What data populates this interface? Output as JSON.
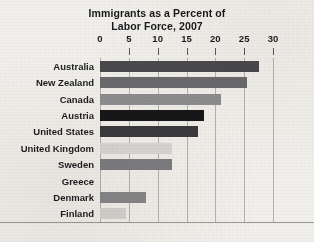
{
  "chart_data": {
    "type": "bar",
    "orientation": "horizontal",
    "title": "Immigrants as a Percent of Labor Force, 2007",
    "title_lines": [
      "Immigrants as a Percent of",
      "Labor Force, 2007"
    ],
    "xlabel": "",
    "ylabel": "",
    "xlim": [
      0,
      30
    ],
    "xticks": [
      0,
      5,
      10,
      15,
      20,
      25,
      30
    ],
    "xtick_labels": [
      "0",
      "5",
      "10",
      "15",
      "20",
      "25",
      "30"
    ],
    "grid": true,
    "grid_axis": "x",
    "legend": false,
    "categories": [
      "Australia",
      "New Zealand",
      "Canada",
      "Austria",
      "United States",
      "United Kingdom",
      "Sweden",
      "Greece",
      "Denmark",
      "Finland"
    ],
    "values": [
      27.5,
      25.5,
      21.0,
      18.0,
      17.0,
      12.5,
      12.5,
      0.0,
      8.0,
      4.5
    ],
    "bar_colors": [
      "#4a4a4d",
      "#6b6b6e",
      "#8e8e90",
      "#171719",
      "#3b3b3e",
      "#d8d7d4",
      "#7d7d80",
      "#f0eeea",
      "#878789",
      "#d5d3d0"
    ],
    "series": [
      {
        "name": "Immigrants as a Percent of Labor Force, 2007",
        "values": [
          27.5,
          25.5,
          21.0,
          18.0,
          17.0,
          12.5,
          12.5,
          0.0,
          8.0,
          4.5
        ]
      }
    ]
  },
  "style": {
    "background_color": "#f2f0ec",
    "text_color": "#1c1c21",
    "gridline_color": "#b4b2ad",
    "axis_color": "#9a9893"
  }
}
